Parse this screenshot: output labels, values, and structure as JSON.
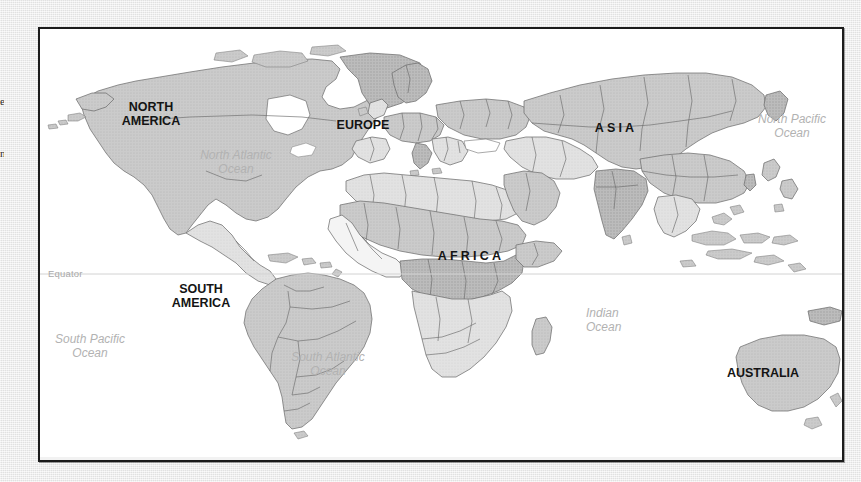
{
  "page": {
    "background_color": "#e9e9e9",
    "frame_border_color": "#1b1b1b",
    "ocean_fill": "#ffffff",
    "land_fill": "#c9c9c9",
    "border_line_color": "#6b6b6b",
    "label_dark": "#141414",
    "label_gray": "#b2b2b2"
  },
  "edge_fragments": [
    {
      "text": "e",
      "top": 96
    },
    {
      "text": "n",
      "top": 148
    }
  ],
  "map": {
    "title": "World Map",
    "continents": [
      {
        "name": "north-america",
        "label": "NORTH\nAMERICA",
        "line1": "NORTH",
        "line2": "AMERICA",
        "x": 137,
        "y": 107
      },
      {
        "name": "south-america",
        "label": "SOUTH\nAMERICA",
        "line1": "SOUTH",
        "line2": "AMERICA",
        "x": 197,
        "y": 288
      },
      {
        "name": "europe",
        "label": "EUROPE",
        "line1": "EUROPE",
        "line2": "",
        "x": 355,
        "y": 125
      },
      {
        "name": "africa",
        "label": "AFRICA",
        "line1": "AFRICA",
        "line2": "",
        "x": 464,
        "y": 256
      },
      {
        "name": "asia",
        "label": "ASIA",
        "line1": "ASIA",
        "line2": "",
        "x": 614,
        "y": 128
      },
      {
        "name": "australia",
        "label": "AUSTRALIA",
        "line1": "AUSTRALIA",
        "line2": "",
        "x": 761,
        "y": 372
      }
    ],
    "oceans": [
      {
        "name": "north-atlantic-ocean",
        "line1": "North Atlantic",
        "line2": "Ocean",
        "x": 232,
        "y": 153,
        "align": "center"
      },
      {
        "name": "north-pacific-ocean",
        "line1": "North Pacific",
        "line2": "Ocean",
        "x": 790,
        "y": 117,
        "align": "center"
      },
      {
        "name": "south-pacific-ocean",
        "line1": "South Pacific",
        "line2": "Ocean",
        "x": 88,
        "y": 337,
        "align": "center"
      },
      {
        "name": "south-atlantic-ocean",
        "line1": "South Atlantic",
        "line2": "Ocean",
        "x": 326,
        "y": 355,
        "align": "center"
      },
      {
        "name": "indian-ocean",
        "line1": "Indian",
        "line2": "Ocean",
        "x": 592,
        "y": 311,
        "align": "left"
      }
    ],
    "equator": {
      "label": "Equator",
      "label_x": 48,
      "y": 272,
      "line_color": "#d2d2d2"
    }
  }
}
